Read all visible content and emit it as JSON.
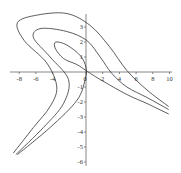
{
  "chart_data": {
    "type": "line",
    "title": "",
    "xlabel": "",
    "ylabel": "",
    "xlim": [
      -9,
      10
    ],
    "ylim": [
      -6.5,
      3.8
    ],
    "grid": false,
    "legend": null,
    "x_ticks": [
      "-8",
      "-6",
      "-4",
      "0",
      "2",
      "4",
      "6",
      "8",
      "10"
    ],
    "y_ticks": [
      "3",
      "2",
      "1",
      "0",
      "-1",
      "-2",
      "-3",
      "-4",
      "-5",
      "-6"
    ],
    "series": [
      {
        "name": "outer-level-curve",
        "points": [
          [
            -8.7,
            -5.4
          ],
          [
            -6.3,
            -3.7
          ],
          [
            -4.3,
            -2.3
          ],
          [
            -3.5,
            -1.0
          ],
          [
            -4.7,
            0.6
          ],
          [
            -7.4,
            2.1
          ],
          [
            -8.2,
            3.3
          ],
          [
            -5.8,
            3.8
          ],
          [
            -2.3,
            3.9
          ],
          [
            0.5,
            3.1
          ],
          [
            2.8,
            1.7
          ],
          [
            4.9,
            0.1
          ],
          [
            7.3,
            -1.2
          ],
          [
            9.9,
            -2.3
          ]
        ]
      },
      {
        "name": "middle-level-curve",
        "points": [
          [
            -8.4,
            -5.5
          ],
          [
            -5.1,
            -3.7
          ],
          [
            -2.7,
            -2.1
          ],
          [
            -2.1,
            -0.5
          ],
          [
            -4.3,
            1.0
          ],
          [
            -6.3,
            2.3
          ],
          [
            -5.4,
            2.9
          ],
          [
            -2.3,
            2.7
          ],
          [
            0.1,
            2.1
          ],
          [
            1.7,
            1.0
          ],
          [
            3.1,
            -0.1
          ],
          [
            4.9,
            -1.0
          ],
          [
            7.3,
            -1.7
          ],
          [
            9.9,
            -2.5
          ]
        ]
      },
      {
        "name": "inner-level-curve",
        "points": [
          [
            -8.2,
            -5.5
          ],
          [
            -4.3,
            -3.7
          ],
          [
            -1.1,
            -1.9
          ],
          [
            -0.1,
            -0.5
          ],
          [
            0.0,
            0.3
          ],
          [
            -0.7,
            1.1
          ],
          [
            -2.3,
            1.8
          ],
          [
            -3.6,
            2.0
          ],
          [
            -3.7,
            1.6
          ],
          [
            -2.7,
            0.9
          ],
          [
            -1.1,
            0.5
          ],
          [
            0.0,
            0.1
          ],
          [
            1.7,
            -0.5
          ],
          [
            4.9,
            -1.5
          ],
          [
            7.3,
            -2.1
          ],
          [
            9.9,
            -2.8
          ]
        ]
      }
    ]
  }
}
